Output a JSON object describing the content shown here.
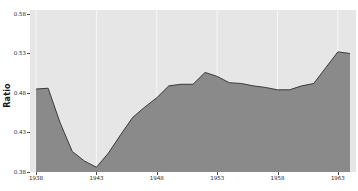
{
  "chart_data": {
    "type": "area",
    "title": "",
    "xlabel": "",
    "ylabel": "Ratio",
    "xlim": [
      1937.5,
      1964.5
    ],
    "ylim": [
      0.38,
      0.585
    ],
    "grid": true,
    "grid_orientation": "vertical",
    "legend": "none",
    "xticks": [
      1938,
      1943,
      1948,
      1953,
      1958,
      1963
    ],
    "xtick_labels": [
      "1938",
      "1943",
      "1948",
      "1953",
      "1958",
      "1963"
    ],
    "yticks": [
      0.38,
      0.43,
      0.48,
      0.53,
      0.58
    ],
    "ytick_labels": [
      "0.38",
      "0.43",
      "0.48",
      "0.53",
      "0.58"
    ],
    "x": [
      1938,
      1939,
      1940,
      1941,
      1942,
      1943,
      1944,
      1945,
      1946,
      1947,
      1948,
      1949,
      1950,
      1951,
      1952,
      1953,
      1954,
      1955,
      1956,
      1957,
      1958,
      1959,
      1960,
      1961,
      1962,
      1963,
      1964
    ],
    "values": [
      0.485,
      0.486,
      0.442,
      0.406,
      0.394,
      0.386,
      0.404,
      0.427,
      0.449,
      0.462,
      0.474,
      0.489,
      0.491,
      0.491,
      0.506,
      0.501,
      0.493,
      0.492,
      0.489,
      0.487,
      0.484,
      0.484,
      0.489,
      0.492,
      0.512,
      0.532,
      0.53
    ],
    "series": [
      {
        "name": "Ratio",
        "fill_color": "#8a8a8a",
        "line_color": "#3a3a3a",
        "values": [
          0.485,
          0.486,
          0.442,
          0.406,
          0.394,
          0.386,
          0.404,
          0.427,
          0.449,
          0.462,
          0.474,
          0.489,
          0.491,
          0.491,
          0.506,
          0.501,
          0.493,
          0.492,
          0.489,
          0.487,
          0.484,
          0.484,
          0.489,
          0.492,
          0.512,
          0.532,
          0.53
        ]
      }
    ],
    "colors": {
      "plot_background": "#e6e6e6",
      "figure_background": "#ffffff",
      "gridline": "#f7f7f7",
      "area_fill": "#8a8a8a",
      "area_edge": "#3a3a3a",
      "tick_text": "#2b2b2b",
      "axis_label": "#1a1a1a"
    }
  }
}
